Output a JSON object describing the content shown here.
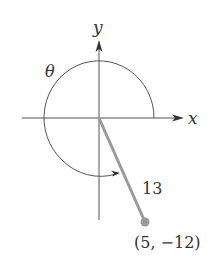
{
  "diagram": {
    "type": "angle-in-standard-position",
    "axes": {
      "x_label": "x",
      "y_label": "y"
    },
    "angle_label": "θ",
    "segment_length_label": "13",
    "point_label": "(5, −12)",
    "point": {
      "x": 5,
      "y": -12
    },
    "radius": 13,
    "colors": {
      "axis": "#444444",
      "arc": "#555555",
      "terminal_side": "#9a9a9a",
      "point": "#9a9a9a",
      "text": "#333333"
    }
  }
}
